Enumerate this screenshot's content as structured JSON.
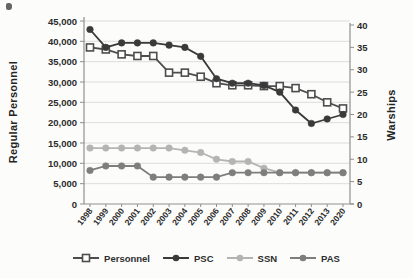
{
  "chart_data": {
    "type": "line",
    "title": "",
    "x_categories": [
      "1998",
      "1999",
      "2000",
      "2001",
      "2002",
      "2003",
      "2004",
      "2005",
      "2006",
      "2007",
      "2008",
      "2009",
      "2010",
      "2011",
      "2012",
      "2013",
      "2020"
    ],
    "left_axis": {
      "label": "Regular Personnel",
      "min": 0,
      "max": 45000,
      "tick_values": [
        0,
        5000,
        10000,
        15000,
        20000,
        25000,
        30000,
        35000,
        40000,
        45000
      ],
      "tick_labels": [
        "0",
        "5,000",
        "10,000",
        "15,000",
        "20,000",
        "25,000",
        "30,000",
        "35,000",
        "40,000",
        "45,000"
      ]
    },
    "right_axis": {
      "label": "Warships",
      "min": 0,
      "max": 40,
      "tick_values": [
        0,
        5,
        10,
        15,
        20,
        25,
        30,
        35,
        40
      ],
      "tick_labels": [
        "0",
        "5",
        "10",
        "15",
        "20",
        "25",
        "30",
        "35",
        "40"
      ]
    },
    "grid": true,
    "legend_position": "bottom",
    "series": [
      {
        "name": "Personnel",
        "axis": "left",
        "marker": "square-open",
        "color": "#4d4d4d",
        "values": [
          38500,
          38000,
          36800,
          36400,
          36400,
          32300,
          32300,
          31300,
          29700,
          29200,
          29200,
          29000,
          29000,
          28500,
          27000,
          25000,
          23500
        ]
      },
      {
        "name": "PSC",
        "axis": "right",
        "marker": "circle",
        "color": "#3a3a3a",
        "values": [
          39,
          35,
          36,
          36,
          36,
          35.5,
          35,
          33,
          28,
          27,
          27,
          26.5,
          25,
          21,
          18,
          19,
          20
        ]
      },
      {
        "name": "SSN",
        "axis": "right",
        "marker": "circle",
        "color": "#b4b4b4",
        "values": [
          12.5,
          12.5,
          12.5,
          12.5,
          12.5,
          12.5,
          12,
          11.5,
          10,
          9.5,
          9.5,
          8,
          7,
          7,
          7,
          7,
          7
        ]
      },
      {
        "name": "PAS",
        "axis": "right",
        "marker": "circle",
        "color": "#7e7e7e",
        "values": [
          7.5,
          8.5,
          8.5,
          8.5,
          6,
          6,
          6,
          6,
          6,
          7,
          7,
          7,
          7,
          7,
          7,
          7,
          7
        ]
      }
    ]
  }
}
